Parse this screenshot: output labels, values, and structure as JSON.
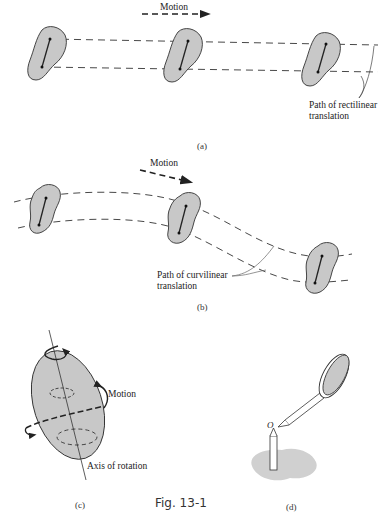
{
  "figure": {
    "title": "Fig. 13-1",
    "panels": [
      {
        "id": "a",
        "caption": "(a)",
        "motion_label": "Motion",
        "path_label_line1": "Path of rectilinear",
        "path_label_line2": "translation"
      },
      {
        "id": "b",
        "caption": "(b)",
        "motion_label": "Motion",
        "path_label_line1": "Path of curvilinear",
        "path_label_line2": "translation"
      },
      {
        "id": "c",
        "caption": "(c)",
        "motion_label": "Motion",
        "axis_label": "Axis of rotation"
      },
      {
        "id": "d",
        "caption": "(d)",
        "point_label": "O"
      }
    ]
  },
  "colors": {
    "body_fill": "#c8c8c8",
    "stroke": "#333333",
    "shadow": "#d0d0d0"
  }
}
